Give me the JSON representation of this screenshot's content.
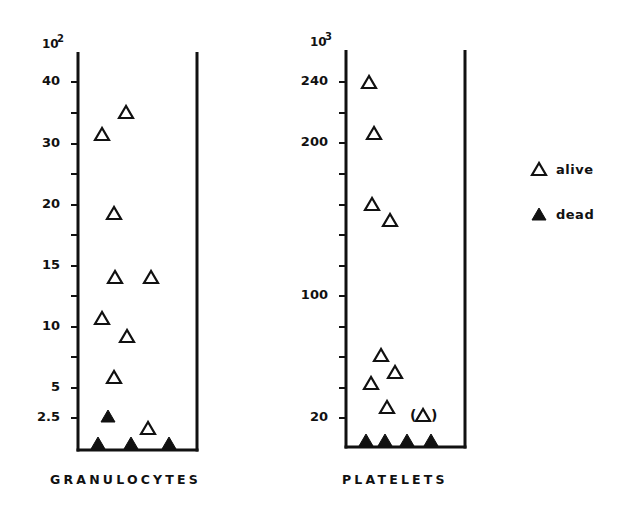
{
  "chart_data": [
    {
      "type": "scatter",
      "title": "GRANULOCYTES",
      "unit": {
        "base": "10",
        "exponent": "2"
      },
      "ylabel": "10^2",
      "xlabel": "",
      "y_tick_labels": [
        "40",
        "30",
        "20",
        "15",
        "10",
        "5",
        "2.5"
      ],
      "y_ticks_note": "evenly spaced minor ticks between labeled ticks",
      "legend": [
        {
          "label": "alive",
          "marker": "open-triangle"
        },
        {
          "label": "dead",
          "marker": "filled-triangle"
        }
      ],
      "series": [
        {
          "name": "alive",
          "marker": "open-triangle",
          "values": [
            35,
            31.5,
            19,
            14,
            14,
            10.5,
            9,
            6,
            2
          ]
        },
        {
          "name": "dead",
          "marker": "filled-triangle",
          "values": [
            3,
            0,
            0,
            0
          ]
        }
      ],
      "grid": false
    },
    {
      "type": "scatter",
      "title": "PLATELETS",
      "unit": {
        "base": "10",
        "exponent": "3"
      },
      "ylabel": "10^3",
      "xlabel": "",
      "y_tick_labels": [
        "240",
        "200",
        "100",
        "20"
      ],
      "y_ticks_note": "evenly spaced minor ticks between labeled ticks",
      "legend": [
        {
          "label": "alive",
          "marker": "open-triangle"
        },
        {
          "label": "dead",
          "marker": "filled-triangle"
        }
      ],
      "series": [
        {
          "name": "alive",
          "marker": "open-triangle",
          "values": [
            240,
            205,
            155,
            145,
            60,
            50,
            45,
            30
          ]
        },
        {
          "name": "alive (uncertain, parenthesized)",
          "marker": "open-triangle-in-parentheses",
          "values": [
            20
          ]
        },
        {
          "name": "dead",
          "marker": "filled-triangle",
          "values": [
            0,
            0,
            0,
            0
          ]
        }
      ],
      "grid": false
    }
  ],
  "panels": {
    "granulocytes": {
      "title": "GRANULOCYTES",
      "unit_base": "10",
      "unit_exp": "2",
      "axis": {
        "x_left": 78,
        "x_right": 197,
        "y_top": 52,
        "y_bottom": 450
      },
      "ticks": [
        {
          "y": 82,
          "label": "40"
        },
        {
          "y": 113,
          "label": ""
        },
        {
          "y": 144,
          "label": "30"
        },
        {
          "y": 174,
          "label": ""
        },
        {
          "y": 205,
          "label": "20"
        },
        {
          "y": 235,
          "label": ""
        },
        {
          "y": 266,
          "label": "15"
        },
        {
          "y": 296,
          "label": ""
        },
        {
          "y": 327,
          "label": "10"
        },
        {
          "y": 357,
          "label": ""
        },
        {
          "y": 388,
          "label": "5"
        },
        {
          "y": 418,
          "label": "2.5"
        }
      ],
      "alive": [
        {
          "x": 126,
          "y": 112
        },
        {
          "x": 102,
          "y": 134
        },
        {
          "x": 114,
          "y": 213
        },
        {
          "x": 115,
          "y": 277
        },
        {
          "x": 151,
          "y": 277
        },
        {
          "x": 102,
          "y": 318
        },
        {
          "x": 127,
          "y": 336
        },
        {
          "x": 114,
          "y": 377
        },
        {
          "x": 148,
          "y": 428
        }
      ],
      "dead": [
        {
          "x": 108,
          "y": 416
        },
        {
          "x": 98,
          "y": 443
        },
        {
          "x": 131,
          "y": 443
        },
        {
          "x": 169,
          "y": 443
        }
      ]
    },
    "platelets": {
      "title": "PLATELETS",
      "unit_base": "10",
      "unit_exp": "3",
      "axis": {
        "x_left": 346,
        "x_right": 465,
        "y_top": 50,
        "y_bottom": 447
      },
      "ticks": [
        {
          "y": 82,
          "label": "240"
        },
        {
          "y": 113,
          "label": ""
        },
        {
          "y": 143,
          "label": "200"
        },
        {
          "y": 174,
          "label": ""
        },
        {
          "y": 205,
          "label": ""
        },
        {
          "y": 235,
          "label": ""
        },
        {
          "y": 266,
          "label": ""
        },
        {
          "y": 296,
          "label": "100"
        },
        {
          "y": 327,
          "label": ""
        },
        {
          "y": 357,
          "label": ""
        },
        {
          "y": 388,
          "label": ""
        },
        {
          "y": 418,
          "label": "20"
        }
      ],
      "alive": [
        {
          "x": 369,
          "y": 82
        },
        {
          "x": 374,
          "y": 133
        },
        {
          "x": 372,
          "y": 204
        },
        {
          "x": 390,
          "y": 220
        },
        {
          "x": 381,
          "y": 355
        },
        {
          "x": 395,
          "y": 372
        },
        {
          "x": 371,
          "y": 383
        },
        {
          "x": 387,
          "y": 407
        }
      ],
      "alive_parenthesized": [
        {
          "x": 423,
          "y": 415,
          "open": "(",
          "close": ")"
        }
      ],
      "dead": [
        {
          "x": 366,
          "y": 440
        },
        {
          "x": 385,
          "y": 440
        },
        {
          "x": 407,
          "y": 440
        },
        {
          "x": 431,
          "y": 440
        }
      ]
    }
  },
  "legend": {
    "items": [
      {
        "label": "alive",
        "marker": "open-triangle",
        "x": 539,
        "y": 169
      },
      {
        "label": "dead",
        "marker": "filled-triangle",
        "x": 539,
        "y": 214
      }
    ]
  },
  "colors": {
    "ink": "#111111",
    "background": "#ffffff"
  }
}
